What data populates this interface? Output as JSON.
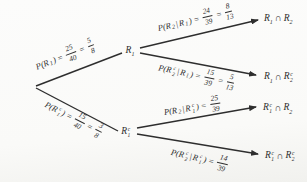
{
  "figure": {
    "type": "probability-tree-diagram",
    "stages": 2
  },
  "colors": {
    "ink": "#2e2e2e",
    "background": "#fbfbf9"
  },
  "nodes": {
    "r1": {
      "base": "R",
      "sub": "1"
    },
    "r1c": {
      "base": "R",
      "sup": "c",
      "sub": "1"
    },
    "t1": {
      "b1": "R",
      "s1": "1",
      "cap": "∩",
      "b2": "R",
      "s2": "2"
    },
    "t2": {
      "b1": "R",
      "s1": "1",
      "cap": "∩",
      "b2": "R",
      "sup2": "c",
      "s2": "2"
    },
    "t3": {
      "b1": "R",
      "sup1": "c",
      "s1": "1",
      "cap": "∩",
      "b2": "R",
      "s2": "2"
    },
    "t4": {
      "b1": "R",
      "sup1": "c",
      "s1": "1",
      "cap": "∩",
      "b2": "R",
      "sup2": "c",
      "s2": "2"
    }
  },
  "branches": {
    "b1": {
      "t1": "P(R",
      "s1": "1",
      "t4": ")",
      "eq1": "=",
      "f1n": "25",
      "f1d": "40",
      "eq2": "=",
      "f2n": "5",
      "f2d": "8"
    },
    "b2": {
      "t1": "P(R",
      "sup1": "c",
      "s1": "1",
      "t4": ")",
      "eq1": "=",
      "f1n": "15",
      "f1d": "40",
      "eq2": "=",
      "f2n": "3",
      "f2d": "8"
    },
    "b3": {
      "t1": "P(R",
      "s1": "2",
      "bar": "|",
      "t3": "R",
      "s2": "1",
      "t4": ")",
      "eq1": "=",
      "f1n": "24",
      "f1d": "39",
      "eq2": "=",
      "f2n": "8",
      "f2d": "13"
    },
    "b4": {
      "t1": "P(R",
      "sup1": "c",
      "s1": "2",
      "bar": "|",
      "t3": "R",
      "s2": "1",
      "t4": ")",
      "eq1": "=",
      "f1n": "15",
      "f1d": "39",
      "eq2": "=",
      "f2n": "5",
      "f2d": "13"
    },
    "b5": {
      "t1": "P(R",
      "s1": "2",
      "bar": "|",
      "t3": "R",
      "sup2": "c",
      "s2": "1",
      "t4": ")",
      "eq1": "=",
      "f1n": "25",
      "f1d": "39"
    },
    "b6": {
      "t1": "P(R",
      "sup1": "c",
      "s1": "2",
      "bar": "|",
      "t3": "R",
      "sup2": "c",
      "s2": "1",
      "t4": ")",
      "eq1": "=",
      "f1n": "14",
      "f1d": "39"
    }
  }
}
